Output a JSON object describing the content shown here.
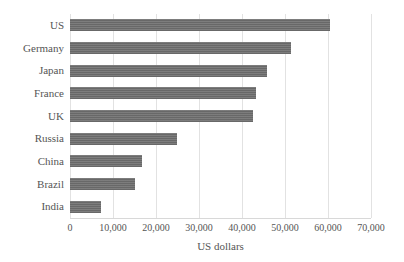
{
  "chart_data": {
    "type": "bar",
    "orientation": "horizontal",
    "title": "",
    "xlabel": "US dollars",
    "ylabel": "",
    "categories": [
      "US",
      "Germany",
      "Japan",
      "France",
      "UK",
      "Russia",
      "China",
      "Brazil",
      "India"
    ],
    "values": [
      60500,
      51500,
      45700,
      43200,
      42500,
      24900,
      16800,
      15000,
      7200
    ],
    "series": [
      {
        "name": "US dollars",
        "values": [
          60500,
          51500,
          45700,
          43200,
          42500,
          24900,
          16800,
          15000,
          7200
        ]
      }
    ],
    "xlim": [
      0,
      70000
    ],
    "xticks": [
      0,
      10000,
      20000,
      30000,
      40000,
      50000,
      60000,
      70000
    ],
    "xtick_labels": [
      "0",
      "10,000",
      "20,000",
      "30,000",
      "40,000",
      "50,000",
      "60,000",
      "70,000"
    ],
    "grid": true,
    "grid_axis": "x",
    "legend": false,
    "legend_position": "none",
    "bar_color": "#6e6e6e",
    "gridline_color": "#e2e2e2",
    "text_color": "#555555",
    "background_color": "#ffffff"
  }
}
